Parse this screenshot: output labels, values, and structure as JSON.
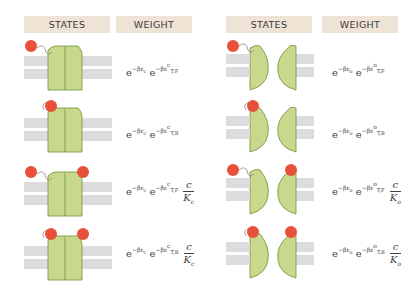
{
  "headers": {
    "left_states": "STATES",
    "left_weight": "WEIGHT",
    "right_states": "STATES",
    "right_weight": "WEIGHT"
  },
  "colors": {
    "header_bg": "#efe3d6",
    "channel_fill": "#c8d98e",
    "channel_stroke": "#6f8f3a",
    "ligand": "#e8503a",
    "membrane": "#dcdcdc"
  },
  "rows_closed": [
    {
      "state": "closed, tether free, no ligand",
      "w1": "e",
      "w1_sup": "−βε",
      "w1_sub": "c",
      "w2": "e",
      "w2_sup": "−βε",
      "w2_supsup": "c",
      "w2_sub": "T,F",
      "frac_num": "",
      "frac_den": "",
      "frac_den_sub": ""
    },
    {
      "state": "closed, tether bound, no ligand",
      "w1": "e",
      "w1_sup": "−βε",
      "w1_sub": "c",
      "w2": "e",
      "w2_sup": "−βε",
      "w2_supsup": "c",
      "w2_sub": "T,B",
      "frac_num": "",
      "frac_den": "",
      "frac_den_sub": ""
    },
    {
      "state": "closed, tether free, ligand bound",
      "w1": "e",
      "w1_sup": "−βε",
      "w1_sub": "c",
      "w2": "e",
      "w2_sup": "−βε",
      "w2_supsup": "c",
      "w2_sub": "T,F",
      "frac_num": "c",
      "frac_den": "K",
      "frac_den_sub": "c"
    },
    {
      "state": "closed, tether bound, ligand bound",
      "w1": "e",
      "w1_sup": "−βε",
      "w1_sub": "c",
      "w2": "e",
      "w2_sup": "−βε",
      "w2_supsup": "c",
      "w2_sub": "T,B",
      "frac_num": "c",
      "frac_den": "K",
      "frac_den_sub": "c"
    }
  ],
  "rows_open": [
    {
      "state": "open, tether free, no ligand",
      "w1": "e",
      "w1_sup": "−βε",
      "w1_sub": "o",
      "w2": "e",
      "w2_sup": "−βε",
      "w2_supsup": "o",
      "w2_sub": "T,F",
      "frac_num": "",
      "frac_den": "",
      "frac_den_sub": ""
    },
    {
      "state": "open, tether bound, no ligand",
      "w1": "e",
      "w1_sup": "−βε",
      "w1_sub": "o",
      "w2": "e",
      "w2_sup": "−βε",
      "w2_supsup": "o",
      "w2_sub": "T,B",
      "frac_num": "",
      "frac_den": "",
      "frac_den_sub": ""
    },
    {
      "state": "open, tether free, ligand bound",
      "w1": "e",
      "w1_sup": "−βε",
      "w1_sub": "o",
      "w2": "e",
      "w2_sup": "−βε",
      "w2_supsup": "o",
      "w2_sub": "T,F",
      "frac_num": "c",
      "frac_den": "K",
      "frac_den_sub": "o"
    },
    {
      "state": "open, tether bound, ligand bound",
      "w1": "e",
      "w1_sup": "−βε",
      "w1_sub": "o",
      "w2": "e",
      "w2_sup": "−βε",
      "w2_supsup": "o",
      "w2_sub": "T,B",
      "frac_num": "c",
      "frac_den": "K",
      "frac_den_sub": "o"
    }
  ]
}
